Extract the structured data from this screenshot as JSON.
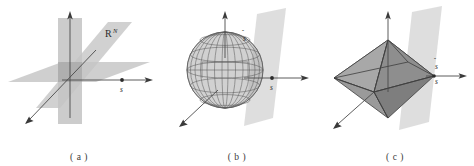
{
  "figure": {
    "background_color": "#ffffff",
    "panels": [
      {
        "id": "panel-a",
        "caption": "( a )",
        "description": "Three mutually intersecting translucent planes spanning R^N with three coordinate axes and a marked point s on the horizontal axis",
        "labels": {
          "space": "R",
          "space_superscript": "N",
          "point": "s"
        },
        "colors": {
          "plane_fill": "#c9c9c9",
          "plane_fill_alt": "#bdbdbd",
          "axis": "#4a4a4a",
          "text": "#2e2e2e"
        },
        "geometry": {
          "planes": 3,
          "axes": 3,
          "marked_points": 1
        }
      },
      {
        "id": "panel-b",
        "caption": "( b )",
        "description": "Wireframe sphere centered at the origin with a tilted translucent plane, three coordinate axes, a marked point s on the horizontal axis and the unit vector s-hat along the vertical axis",
        "labels": {
          "unit_vector": "s",
          "unit_vector_accent": "hat",
          "point": "s"
        },
        "colors": {
          "plane_fill": "#d6d6d6",
          "sphere_wire": "#5e5e5e",
          "sphere_fill": "#a9a9a9",
          "axis": "#4a4a4a",
          "text": "#2e2e2e"
        },
        "geometry": {
          "meridians": 13,
          "parallels": 5,
          "planes": 1,
          "axes": 3,
          "marked_points": 1
        }
      },
      {
        "id": "panel-c",
        "caption": "( c )",
        "description": "Shaded octahedron (cross-polytope) centered at the origin with a tilted translucent plane, three coordinate axes, and labels s-hat and s at the right vertex",
        "labels": {
          "unit_vector": "s",
          "unit_vector_accent": "hat",
          "point": "s"
        },
        "colors": {
          "plane_fill": "#d6d6d6",
          "face_light": "#b0b0b0",
          "face_mid": "#9a9a9a",
          "face_dark": "#7f7f7f",
          "face_darker": "#8c8c8c",
          "edge": "#3d3d3d",
          "axis": "#4a4a4a",
          "text": "#2e2e2e"
        },
        "geometry": {
          "vertices": 6,
          "faces_visible": 4,
          "planes": 1,
          "axes": 3
        }
      }
    ]
  }
}
